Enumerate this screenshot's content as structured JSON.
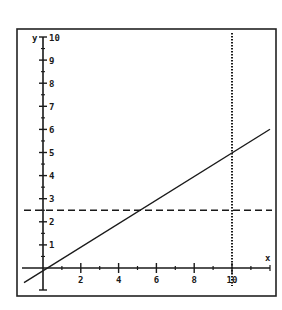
{
  "chart_data": {
    "type": "line",
    "title": "",
    "xlabel": "x",
    "ylabel": "y",
    "xlim": [
      -1,
      12
    ],
    "ylim": [
      -1,
      10
    ],
    "x_ticks_major": [
      2,
      4,
      6,
      8,
      10
    ],
    "x_tick_labels": [
      "2",
      "4",
      "6",
      "8",
      "10"
    ],
    "x_ticks_minor": [
      1,
      3,
      5,
      7,
      9,
      11
    ],
    "y_ticks_major": [
      1,
      2,
      3,
      4,
      5,
      6,
      7,
      8,
      9,
      10
    ],
    "y_tick_labels": [
      "1",
      "2",
      "3",
      "4",
      "5",
      "6",
      "7",
      "8",
      "9",
      "10"
    ],
    "y_tick_minor_step": 0.5,
    "grid": false,
    "legend": null,
    "series": [
      {
        "name": "y = 0.5x",
        "style": "solid",
        "x": [
          -1,
          0,
          2,
          4,
          6,
          8,
          10,
          12
        ],
        "y": [
          -0.5,
          0,
          1,
          2,
          3,
          4,
          5,
          6
        ]
      },
      {
        "name": "y = 2.5",
        "style": "dashed",
        "x": [
          -1,
          12
        ],
        "y": [
          2.5,
          2.5
        ]
      },
      {
        "name": "x = 10",
        "style": "dotted",
        "x": [
          10,
          10
        ],
        "y": [
          -1,
          10
        ]
      }
    ],
    "colors": {
      "line": "#1a1a1a",
      "frame": "#222222",
      "background": "#ffffff"
    }
  }
}
